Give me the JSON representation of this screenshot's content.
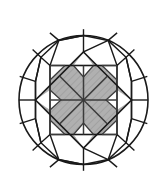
{
  "figure": {
    "type": "line-diagram",
    "canvas": {
      "width": 168,
      "height": 186,
      "background": "#ffffff"
    },
    "colors": {
      "outline": "#1a1a1a",
      "fill_gray": "#a8a8a8",
      "fill_gray_light": "#b4b4b4",
      "hatch": "#9a9a9a",
      "background": "#ffffff"
    },
    "stroke_widths": {
      "girdle": 1.6,
      "facet": 1.5,
      "star": 1.4,
      "thin": 1.1
    },
    "geometry": {
      "center": {
        "cx": 83.5,
        "cy": 100
      },
      "girdle_radius": 64.5,
      "octagon_radius": 60.5,
      "table_square": {
        "x": 50,
        "y": 65.5,
        "width": 67,
        "height": 69,
        "half": 33.5
      },
      "rotated_square_radius": 48,
      "star_inner_radius": 10.5,
      "chevron_depth": 13
    }
  },
  "labels": {
    "girdle": "girdle-circle",
    "table": "table-square",
    "kite": "rotated-square",
    "pavilion": "radial-facet-lines",
    "stars": "star-facets",
    "chevrons": "chevron-facets"
  }
}
